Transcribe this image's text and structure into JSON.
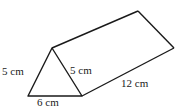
{
  "diagram": {
    "shape": "triangular prism",
    "labels": {
      "left_side": "5 cm",
      "right_side": "5 cm",
      "base": "6 cm",
      "length": "12 cm"
    },
    "colors": {
      "stroke": "#1a1a1a",
      "background": "#ffffff"
    }
  }
}
